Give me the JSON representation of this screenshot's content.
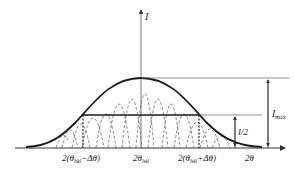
{
  "diagram": {
    "type": "xrd-peak-broadening",
    "axis": {
      "y_label": "I",
      "x_label": "2θ"
    },
    "x_ticks": [
      {
        "id": "minus",
        "label": "2(θ",
        "sub": "hkl",
        "tail": "−Δθ)"
      },
      {
        "id": "center",
        "label": "2θ",
        "sub": "hkl"
      },
      {
        "id": "plus",
        "label": "2(θ",
        "sub": "hkl",
        "tail": "+Δθ)"
      }
    ],
    "annotations": {
      "max_label": "I",
      "max_sub": "max",
      "half_label": "I/2"
    },
    "colors": {
      "curve": "#1a1a1a",
      "dashed": "#555555",
      "axis": "#333333",
      "guide": "#666666"
    }
  }
}
